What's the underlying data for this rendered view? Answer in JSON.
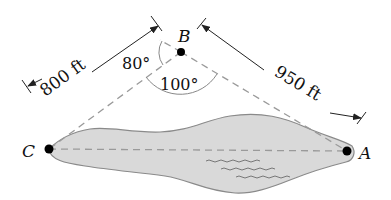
{
  "figure": {
    "points": {
      "A": {
        "label": "A"
      },
      "B": {
        "label": "B"
      },
      "C": {
        "label": "C"
      }
    },
    "dimensions": {
      "BC": {
        "label": "800 ft"
      },
      "BA": {
        "label": "950 ft"
      }
    },
    "angles": {
      "left": {
        "label": "80°"
      },
      "bottom": {
        "label": "100°"
      }
    },
    "colors": {
      "lake_fill": "#d9d9d9",
      "lake_stroke": "#8a8a8a",
      "dash_line": "#9a9a9a",
      "ink": "#111111"
    }
  }
}
